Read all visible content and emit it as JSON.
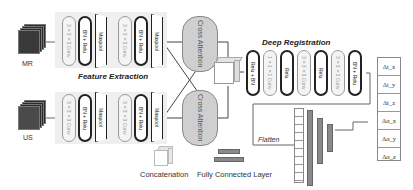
{
  "inputs": {
    "mr_label": "MR",
    "us_label": "US"
  },
  "feature_extraction": {
    "title": "Feature Extraction",
    "branch_layers": [
      {
        "label": "3×3×3 Conv",
        "style": "light"
      },
      {
        "label": "BN + Relu",
        "style": "dark"
      },
      {
        "label": "Maxpool",
        "style": "maxpool"
      },
      {
        "label": "3×3×3 Conv",
        "style": "light"
      },
      {
        "label": "BN + Relu",
        "style": "dark"
      },
      {
        "label": "Maxpool",
        "style": "maxpool"
      }
    ]
  },
  "cross_attention": {
    "top_label": "Cross Attention",
    "bottom_label": "Cross Attention"
  },
  "deep_registration": {
    "title": "Deep Registration",
    "layers": [
      {
        "label": "Relu + BN",
        "style": "dark"
      },
      {
        "label": "1×1×1 Conv",
        "style": "light"
      },
      {
        "label": "Relu",
        "style": "dark"
      },
      {
        "label": "3×3×3 Conv",
        "style": "light"
      },
      {
        "label": "Relu",
        "style": "dark"
      },
      {
        "label": "3×3×3 Conv",
        "style": "light"
      },
      {
        "label": "BN + Relu",
        "style": "dark"
      }
    ]
  },
  "flatten_label": "Flatten",
  "legend": {
    "concatenation": "Concatenation",
    "fully_connected": "Fully Connected Layer"
  },
  "outputs": [
    "Δt_x",
    "Δt_y",
    "Δt_z",
    "Δα_x",
    "Δα_y",
    "Δα_z"
  ],
  "colors": {
    "panel_bg": "#efefef",
    "dark_pill_border": "#222222",
    "light_pill_border": "#999999",
    "cross_attention_fill": "#cfcfcf",
    "fc_fill": "#8a8a8a"
  }
}
